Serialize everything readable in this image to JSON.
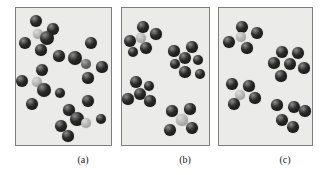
{
  "figure": {
    "background_color": "#ffffff",
    "panel_background_color": "#ebebe9",
    "panel_border_color": "#7d7d7d",
    "dark_sphere_color": "#2a2a2a",
    "light_sphere_color": "#b9b9b7",
    "mid_sphere_color": "#6e6e6e",
    "sphere_highlight_color": "#8d8d8d"
  },
  "captions": [
    {
      "label": "(a)",
      "x": 63,
      "y": 154,
      "width": 40
    },
    {
      "label": "(b)",
      "x": 165,
      "y": 154,
      "width": 40
    },
    {
      "label": "(c)",
      "x": 265,
      "y": 154,
      "width": 40
    }
  ],
  "panels": [
    {
      "id": "panel-a",
      "label": "(a)",
      "description": "randomly dispersed particles",
      "x": 15,
      "y": 7,
      "width": 97,
      "height": 139,
      "sphere_count": 25,
      "light_sphere_count": 3,
      "spheres": [
        {
          "cx": 20,
          "cy": 13,
          "r": 6.0,
          "shade": "dark"
        },
        {
          "cx": 37,
          "cy": 21,
          "r": 5.8,
          "shade": "dark"
        },
        {
          "cx": 22,
          "cy": 26,
          "r": 5.2,
          "shade": "light"
        },
        {
          "cx": 31,
          "cy": 30,
          "r": 7.2,
          "shade": "dark"
        },
        {
          "cx": 9,
          "cy": 35,
          "r": 6.2,
          "shade": "dark"
        },
        {
          "cx": 25,
          "cy": 42,
          "r": 5.6,
          "shade": "dark"
        },
        {
          "cx": 75,
          "cy": 35,
          "r": 6.0,
          "shade": "dark"
        },
        {
          "cx": 43,
          "cy": 48,
          "r": 5.6,
          "shade": "dark"
        },
        {
          "cx": 59,
          "cy": 50,
          "r": 7.0,
          "shade": "dark"
        },
        {
          "cx": 70,
          "cy": 56,
          "r": 5.4,
          "shade": "mid"
        },
        {
          "cx": 86,
          "cy": 59,
          "r": 5.6,
          "shade": "dark"
        },
        {
          "cx": 26,
          "cy": 62,
          "r": 6.4,
          "shade": "dark"
        },
        {
          "cx": 6,
          "cy": 73,
          "r": 6.0,
          "shade": "dark"
        },
        {
          "cx": 21,
          "cy": 74,
          "r": 5.4,
          "shade": "light"
        },
        {
          "cx": 72,
          "cy": 70,
          "r": 5.6,
          "shade": "dark"
        },
        {
          "cx": 28,
          "cy": 82,
          "r": 7.0,
          "shade": "dark"
        },
        {
          "cx": 44,
          "cy": 85,
          "r": 5.4,
          "shade": "dark"
        },
        {
          "cx": 16,
          "cy": 96,
          "r": 6.0,
          "shade": "dark"
        },
        {
          "cx": 72,
          "cy": 93,
          "r": 5.8,
          "shade": "dark"
        },
        {
          "cx": 53,
          "cy": 102,
          "r": 5.6,
          "shade": "dark"
        },
        {
          "cx": 61,
          "cy": 111,
          "r": 6.8,
          "shade": "dark"
        },
        {
          "cx": 70,
          "cy": 115,
          "r": 5.0,
          "shade": "light"
        },
        {
          "cx": 85,
          "cy": 111,
          "r": 5.4,
          "shade": "dark"
        },
        {
          "cx": 45,
          "cy": 118,
          "r": 5.8,
          "shade": "dark"
        },
        {
          "cx": 52,
          "cy": 128,
          "r": 5.6,
          "shade": "dark"
        }
      ]
    },
    {
      "id": "panel-b",
      "label": "(b)",
      "description": "particles aggregated into separate clusters",
      "x": 121,
      "y": 7,
      "width": 89,
      "height": 139,
      "sphere_count": 22,
      "light_sphere_count": 2,
      "spheres": [
        {
          "cx": 21,
          "cy": 19,
          "r": 5.8,
          "shade": "dark"
        },
        {
          "cx": 34,
          "cy": 26,
          "r": 5.6,
          "shade": "dark"
        },
        {
          "cx": 19,
          "cy": 30,
          "r": 5.4,
          "shade": "light"
        },
        {
          "cx": 8,
          "cy": 33,
          "r": 6.0,
          "shade": "dark"
        },
        {
          "cx": 24,
          "cy": 40,
          "r": 5.8,
          "shade": "dark"
        },
        {
          "cx": 11,
          "cy": 44,
          "r": 5.4,
          "shade": "dark"
        },
        {
          "cx": 52,
          "cy": 43,
          "r": 5.6,
          "shade": "dark"
        },
        {
          "cx": 70,
          "cy": 39,
          "r": 5.8,
          "shade": "dark"
        },
        {
          "cx": 63,
          "cy": 50,
          "r": 6.2,
          "shade": "dark"
        },
        {
          "cx": 76,
          "cy": 52,
          "r": 5.4,
          "shade": "dark"
        },
        {
          "cx": 53,
          "cy": 56,
          "r": 5.4,
          "shade": "dark"
        },
        {
          "cx": 63,
          "cy": 64,
          "r": 5.6,
          "shade": "dark"
        },
        {
          "cx": 78,
          "cy": 66,
          "r": 5.4,
          "shade": "dark"
        },
        {
          "cx": 14,
          "cy": 74,
          "r": 5.8,
          "shade": "dark"
        },
        {
          "cx": 27,
          "cy": 78,
          "r": 5.4,
          "shade": "dark"
        },
        {
          "cx": 18,
          "cy": 86,
          "r": 6.4,
          "shade": "dark"
        },
        {
          "cx": 6,
          "cy": 91,
          "r": 5.6,
          "shade": "dark"
        },
        {
          "cx": 28,
          "cy": 93,
          "r": 5.6,
          "shade": "dark"
        },
        {
          "cx": 50,
          "cy": 103,
          "r": 5.6,
          "shade": "dark"
        },
        {
          "cx": 68,
          "cy": 101,
          "r": 5.6,
          "shade": "dark"
        },
        {
          "cx": 60,
          "cy": 112,
          "r": 5.6,
          "shade": "light"
        },
        {
          "cx": 48,
          "cy": 122,
          "r": 5.8,
          "shade": "dark"
        },
        {
          "cx": 70,
          "cy": 120,
          "r": 5.8,
          "shade": "dark"
        }
      ]
    },
    {
      "id": "panel-c",
      "label": "(c)",
      "description": "particles in two loose groups",
      "x": 218,
      "y": 7,
      "width": 95,
      "height": 139,
      "sphere_count": 20,
      "light_sphere_count": 2,
      "spheres": [
        {
          "cx": 23,
          "cy": 19,
          "r": 5.8,
          "shade": "dark"
        },
        {
          "cx": 38,
          "cy": 25,
          "r": 5.8,
          "shade": "dark"
        },
        {
          "cx": 22,
          "cy": 29,
          "r": 5.4,
          "shade": "light"
        },
        {
          "cx": 10,
          "cy": 34,
          "r": 5.8,
          "shade": "dark"
        },
        {
          "cx": 28,
          "cy": 40,
          "r": 5.6,
          "shade": "dark"
        },
        {
          "cx": 63,
          "cy": 44,
          "r": 5.8,
          "shade": "dark"
        },
        {
          "cx": 79,
          "cy": 45,
          "r": 5.8,
          "shade": "dark"
        },
        {
          "cx": 55,
          "cy": 55,
          "r": 5.6,
          "shade": "dark"
        },
        {
          "cx": 71,
          "cy": 56,
          "r": 6.4,
          "shade": "dark"
        },
        {
          "cx": 85,
          "cy": 60,
          "r": 5.6,
          "shade": "dark"
        },
        {
          "cx": 62,
          "cy": 68,
          "r": 5.6,
          "shade": "dark"
        },
        {
          "cx": 13,
          "cy": 76,
          "r": 5.8,
          "shade": "dark"
        },
        {
          "cx": 30,
          "cy": 78,
          "r": 5.6,
          "shade": "dark"
        },
        {
          "cx": 21,
          "cy": 87,
          "r": 5.4,
          "shade": "light"
        },
        {
          "cx": 36,
          "cy": 90,
          "r": 5.6,
          "shade": "dark"
        },
        {
          "cx": 15,
          "cy": 96,
          "r": 5.8,
          "shade": "dark"
        },
        {
          "cx": 58,
          "cy": 97,
          "r": 5.6,
          "shade": "dark"
        },
        {
          "cx": 75,
          "cy": 99,
          "r": 5.8,
          "shade": "dark"
        },
        {
          "cx": 86,
          "cy": 103,
          "r": 5.6,
          "shade": "dark"
        },
        {
          "cx": 63,
          "cy": 112,
          "r": 5.8,
          "shade": "dark"
        },
        {
          "cx": 74,
          "cy": 119,
          "r": 5.8,
          "shade": "dark"
        }
      ]
    }
  ]
}
